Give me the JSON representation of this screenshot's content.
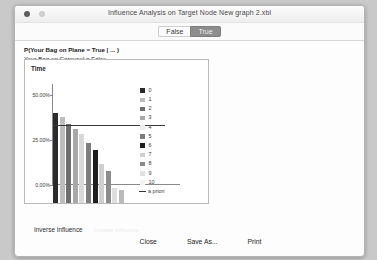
{
  "window": {
    "title": "Influence Analysis on Target Node New graph 2.xbl",
    "close_dot": "close-dot",
    "minimize_dot": "minimize-dot"
  },
  "tabs": [
    {
      "label": "False",
      "selected": false
    },
    {
      "label": "True",
      "selected": true
    }
  ],
  "evidence": {
    "line1": "P(Your Bag on Plane = True | ... )",
    "line2": "Your Bag on Carousel = False"
  },
  "chart_data": {
    "type": "bar",
    "title": "Time",
    "xlabel": "",
    "ylabel": "",
    "ylim": [
      0,
      56
    ],
    "yticks": [
      0,
      25,
      50
    ],
    "ytick_labels": [
      "0.00%",
      "25.00%",
      "50.00%"
    ],
    "grid": false,
    "legend_position": "right",
    "categories": [
      "0",
      "1",
      "2",
      "3",
      "4",
      "5",
      "6",
      "7",
      "8",
      "9",
      "10"
    ],
    "values": [
      50.0,
      47.5,
      44.0,
      41.0,
      38.5,
      33.0,
      29.5,
      21.5,
      17.5,
      8.5,
      7.0
    ],
    "bar_colors": [
      "#2b2b2b",
      "#bdbdbd",
      "#6e6e6e",
      "#a8a8a8",
      "#d8d8d8",
      "#7d7d7d",
      "#1f1f1f",
      "#cfcfcf",
      "#8c8c8c",
      "#e0e0e0",
      "#bbbbbb"
    ],
    "annotations": [
      {
        "name": "a priori",
        "type": "hline",
        "value": 33.0,
        "color": "#3a3a3a"
      }
    ]
  },
  "legend": {
    "entries": [
      {
        "label": "0",
        "color": "#2b2b2b"
      },
      {
        "label": "1",
        "color": "#bdbdbd"
      },
      {
        "label": "2",
        "color": "#6e6e6e"
      },
      {
        "label": "3",
        "color": "#a8a8a8"
      },
      {
        "label": "4",
        "color": "#ededed"
      },
      {
        "label": "5",
        "color": "#7d7d7d"
      },
      {
        "label": "6",
        "color": "#1f1f1f"
      },
      {
        "label": "7",
        "color": "#cfcfcf"
      },
      {
        "label": "8",
        "color": "#8c8c8c"
      },
      {
        "label": "9",
        "color": "#e0e0e0"
      },
      {
        "label": "10",
        "color": "#f4f4f4"
      }
    ],
    "apriori_label": "a priori",
    "apriori_color": "#3a3a3a"
  },
  "inverse": {
    "label": "Inverse Influence",
    "ghost_text": "Inverse Influence"
  },
  "footer": {
    "close_label": "Close",
    "save_as_label": "Save As...",
    "print_label": "Print"
  }
}
